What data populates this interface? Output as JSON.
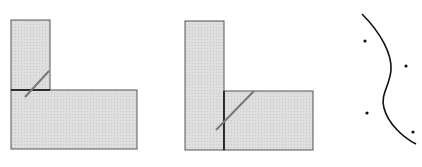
{
  "diagram": {
    "fill_color": "#d9d9d9",
    "stroke_color": "#555555",
    "seam_color": "#111111",
    "cut_color": "#777777",
    "figures": [
      {
        "name": "figure-1-l-shape-horizontal-seam"
      },
      {
        "name": "figure-2-l-shape-vertical-seam"
      },
      {
        "name": "figure-3-curve-with-points",
        "points": 4
      }
    ]
  }
}
